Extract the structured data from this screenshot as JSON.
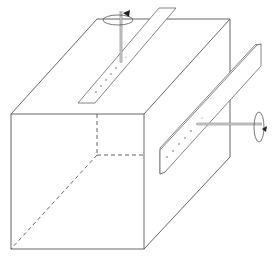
{
  "diagram": {
    "colors": {
      "line": "#555555",
      "rod": "#777777",
      "arrow": "#222222",
      "background": "#ffffff"
    },
    "top_strip": {
      "holes": 6,
      "rod": "vertical",
      "rotation": "counterclockwise-arrow"
    },
    "side_strip": {
      "holes": 6,
      "rod": "horizontal",
      "rotation": "arrow"
    }
  }
}
